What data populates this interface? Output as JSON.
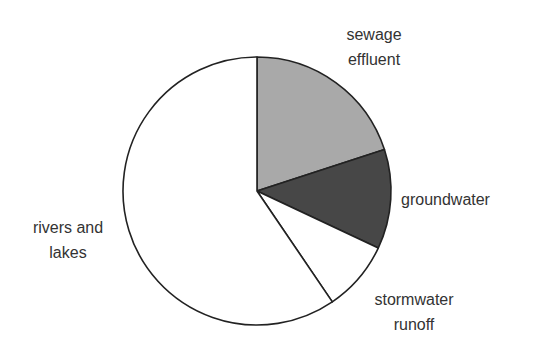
{
  "chart_data": {
    "type": "pie",
    "title": "",
    "start_angle_deg": 0,
    "direction": "clockwise",
    "categories": [
      "sewage effluent",
      "groundwater",
      "stormwater runoff",
      "rivers and lakes"
    ],
    "values": [
      20,
      12,
      8.5,
      59.5
    ],
    "unit": "percent (estimated from slice angles)",
    "colors": [
      "#a9a9a9",
      "#474747",
      "#ffffff",
      "#ffffff"
    ],
    "legend": "none (direct labels)",
    "labels": [
      {
        "lines": [
          "sewage",
          "effluent"
        ],
        "x": 374,
        "y": 40,
        "anchor": "middle"
      },
      {
        "lines": [
          "groundwater"
        ],
        "x": 401,
        "y": 205,
        "anchor": "start"
      },
      {
        "lines": [
          "stormwater",
          "runoff"
        ],
        "x": 414,
        "y": 305,
        "anchor": "middle"
      },
      {
        "lines": [
          "rivers and",
          "lakes"
        ],
        "x": 68,
        "y": 233,
        "anchor": "middle"
      }
    ]
  },
  "geometry": {
    "cx": 257,
    "cy": 191,
    "r": 134,
    "line_height": 24.5,
    "stroke": "#222222"
  }
}
